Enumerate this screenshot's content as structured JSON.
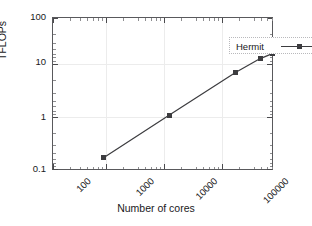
{
  "chart_data": {
    "type": "line",
    "title": "",
    "xlabel": "Number of cores",
    "ylabel": "TFLOPs",
    "xscale": "log",
    "yscale": "log",
    "xlim": [
      100,
      100000
    ],
    "ylim": [
      0.1,
      100
    ],
    "grid": true,
    "legend_position": "top-right-inside",
    "x_ticks": [
      "100",
      "1000",
      "10000",
      "100000"
    ],
    "x_tick_values": [
      100,
      1000,
      10000,
      100000
    ],
    "y_ticks": [
      "0.1",
      "1",
      "10",
      "100"
    ],
    "y_tick_values": [
      0.1,
      1,
      10,
      100
    ],
    "series": [
      {
        "name": "Hermit",
        "marker": "square",
        "color": "#3c3c3f",
        "x": [
          480,
          3800,
          30000,
          65000,
          95000
        ],
        "y": [
          0.18,
          1.25,
          8.5,
          16,
          20
        ]
      }
    ]
  },
  "legend": {
    "entries": [
      {
        "label": "Hermit"
      }
    ]
  },
  "axes": {
    "x_title": "Number of cores",
    "y_title": "TFLOPs",
    "x_tick_labels": [
      "100",
      "1000",
      "10000",
      "100000"
    ],
    "y_tick_labels": [
      "0.1",
      "1",
      "10",
      "100"
    ]
  },
  "colors": {
    "series": "#3c3c3f",
    "frame": "#59595c",
    "grid": "#ececec",
    "text": "#19191b",
    "background": "#ffffff"
  }
}
